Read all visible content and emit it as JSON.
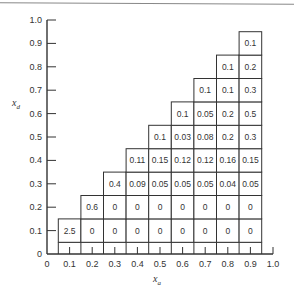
{
  "chart_data": {
    "type": "table",
    "title": "",
    "xlabel": "x_a",
    "ylabel": "x_d",
    "xlim": [
      0,
      1.0
    ],
    "ylim": [
      0,
      1.0
    ],
    "x_ticks": [
      "0",
      "0.1",
      "0.2",
      "0.3",
      "0.4",
      "0.5",
      "0.6",
      "0.7",
      "0.8",
      "0.9",
      "1.0"
    ],
    "y_ticks": [
      "0",
      "0.1",
      "0.2",
      "0.3",
      "0.4",
      "0.5",
      "0.6",
      "0.7",
      "0.8",
      "0.9",
      "1.0"
    ],
    "grid": false,
    "cells": [
      {
        "x": 0.1,
        "y": 0.1,
        "v": "2.5"
      },
      {
        "x": 0.2,
        "y": 0.1,
        "v": "0"
      },
      {
        "x": 0.3,
        "y": 0.1,
        "v": "0"
      },
      {
        "x": 0.4,
        "y": 0.1,
        "v": "0"
      },
      {
        "x": 0.5,
        "y": 0.1,
        "v": "0"
      },
      {
        "x": 0.6,
        "y": 0.1,
        "v": "0"
      },
      {
        "x": 0.7,
        "y": 0.1,
        "v": "0"
      },
      {
        "x": 0.8,
        "y": 0.1,
        "v": "0"
      },
      {
        "x": 0.9,
        "y": 0.1,
        "v": "0"
      },
      {
        "x": 0.2,
        "y": 0.2,
        "v": "0.6"
      },
      {
        "x": 0.3,
        "y": 0.2,
        "v": "0"
      },
      {
        "x": 0.4,
        "y": 0.2,
        "v": "0"
      },
      {
        "x": 0.5,
        "y": 0.2,
        "v": "0"
      },
      {
        "x": 0.6,
        "y": 0.2,
        "v": "0"
      },
      {
        "x": 0.7,
        "y": 0.2,
        "v": "0"
      },
      {
        "x": 0.8,
        "y": 0.2,
        "v": "0"
      },
      {
        "x": 0.9,
        "y": 0.2,
        "v": "0"
      },
      {
        "x": 0.3,
        "y": 0.3,
        "v": "0.4"
      },
      {
        "x": 0.4,
        "y": 0.3,
        "v": "0.09"
      },
      {
        "x": 0.5,
        "y": 0.3,
        "v": "0.05"
      },
      {
        "x": 0.6,
        "y": 0.3,
        "v": "0.05"
      },
      {
        "x": 0.7,
        "y": 0.3,
        "v": "0.05"
      },
      {
        "x": 0.8,
        "y": 0.3,
        "v": "0.04"
      },
      {
        "x": 0.9,
        "y": 0.3,
        "v": "0.05"
      },
      {
        "x": 0.4,
        "y": 0.4,
        "v": "0.11"
      },
      {
        "x": 0.5,
        "y": 0.4,
        "v": "0.15"
      },
      {
        "x": 0.6,
        "y": 0.4,
        "v": "0.12"
      },
      {
        "x": 0.7,
        "y": 0.4,
        "v": "0.12"
      },
      {
        "x": 0.8,
        "y": 0.4,
        "v": "0.16"
      },
      {
        "x": 0.9,
        "y": 0.4,
        "v": "0.15"
      },
      {
        "x": 0.5,
        "y": 0.5,
        "v": "0.1"
      },
      {
        "x": 0.6,
        "y": 0.5,
        "v": "0.03"
      },
      {
        "x": 0.7,
        "y": 0.5,
        "v": "0.08"
      },
      {
        "x": 0.8,
        "y": 0.5,
        "v": "0.2"
      },
      {
        "x": 0.9,
        "y": 0.5,
        "v": "0.3"
      },
      {
        "x": 0.6,
        "y": 0.6,
        "v": "0.1"
      },
      {
        "x": 0.7,
        "y": 0.6,
        "v": "0.05"
      },
      {
        "x": 0.8,
        "y": 0.6,
        "v": "0.2"
      },
      {
        "x": 0.9,
        "y": 0.6,
        "v": "0.5"
      },
      {
        "x": 0.7,
        "y": 0.7,
        "v": "0.1"
      },
      {
        "x": 0.8,
        "y": 0.7,
        "v": "0.1"
      },
      {
        "x": 0.9,
        "y": 0.7,
        "v": "0.3"
      },
      {
        "x": 0.8,
        "y": 0.8,
        "v": "0.1"
      },
      {
        "x": 0.9,
        "y": 0.8,
        "v": "0.2"
      },
      {
        "x": 0.9,
        "y": 0.9,
        "v": "0.1"
      }
    ]
  },
  "axes": {
    "x_label": "x",
    "x_label_sub": "a",
    "y_label": "x",
    "y_label_sub": "d"
  }
}
